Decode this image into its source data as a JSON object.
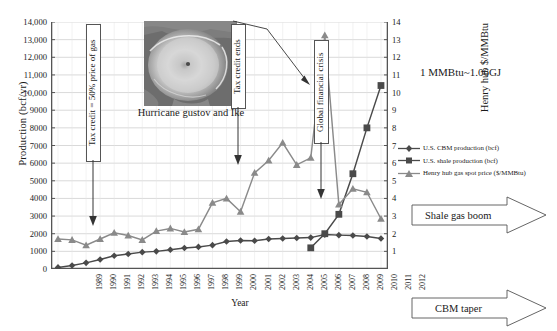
{
  "chart_data": {
    "type": "line",
    "title": "",
    "xlabel": "Year",
    "ylabel": "Production (bcf/yr)",
    "ylabel_right": "Henry hub $/MMBtu",
    "ylim": [
      0,
      14000
    ],
    "ylim_right": [
      0,
      14
    ],
    "grid": true,
    "legend_position": "right",
    "x": [
      1989,
      1990,
      1991,
      1992,
      1993,
      1994,
      1995,
      1996,
      1997,
      1998,
      1999,
      2000,
      2001,
      2002,
      2003,
      2004,
      2005,
      2006,
      2007,
      2008,
      2009,
      2010,
      2011,
      2012
    ],
    "yticks_left": [
      "0",
      "1000",
      "2000",
      "3000",
      "4000",
      "5000",
      "6000",
      "7000",
      "8000",
      "9000",
      "10,000",
      "11,000",
      "12,000",
      "13,000",
      "14,000"
    ],
    "yticks_right": [
      "1",
      "2",
      "3",
      "4",
      "5",
      "6",
      "7",
      "8",
      "9",
      "10",
      "11",
      "12",
      "13",
      "14"
    ],
    "series": [
      {
        "name": "U.S. CBM production (bcf)",
        "axis": "left",
        "marker": "diamond",
        "color": "#4a4a4a",
        "values": [
          90,
          196,
          348,
          539,
          752,
          852,
          956,
          1000,
          1090,
          1194,
          1252,
          1353,
          1562,
          1614,
          1600,
          1700,
          1731,
          1758,
          1780,
          1950,
          1920,
          1900,
          1840,
          1730
        ]
      },
      {
        "name": "U.S. shale production (bcf)",
        "axis": "left",
        "marker": "square",
        "color": "#4a4a4a",
        "values": [
          null,
          null,
          null,
          null,
          null,
          null,
          null,
          null,
          null,
          null,
          null,
          null,
          null,
          null,
          null,
          null,
          null,
          null,
          1200,
          2000,
          3100,
          5400,
          8000,
          10400
        ]
      },
      {
        "name": "Henry hub gas spot price ($/MMBtu)",
        "axis": "right",
        "marker": "triangle",
        "color": "#8a8a8a",
        "values": [
          1.7,
          1.65,
          1.35,
          1.7,
          2.05,
          1.9,
          1.65,
          2.15,
          2.3,
          2.1,
          2.25,
          3.75,
          4.0,
          3.25,
          5.45,
          6.15,
          7.15,
          5.9,
          6.3,
          13.25,
          3.65,
          4.55,
          4.35,
          2.85
        ]
      }
    ],
    "annotations": [
      {
        "id": "tax-credit-start",
        "text": "Tax credit = 50% price of gas",
        "points_to_year": 1991
      },
      {
        "id": "tax-credit-ends",
        "text": "Tax credit ends",
        "points_to_year": 2002
      },
      {
        "id": "global-financial-crisis",
        "text": "Global financial crisis",
        "points_to_year": 2009
      },
      {
        "id": "hurricane-caption",
        "text": "Hurricane gustov and Ike",
        "points_to_year": 2008
      },
      {
        "id": "unit-conversion",
        "text": "1 MMBtu~1.06GJ"
      },
      {
        "id": "shale-gas-boom",
        "text": "Shale gas boom"
      },
      {
        "id": "cbm-taper",
        "text": "CBM  taper"
      }
    ]
  },
  "axes": {
    "left_title": "Production (bcf/yr)",
    "right_title": "Henry hub $/MMBtu",
    "x_title": "Year"
  },
  "legend": {
    "items": [
      {
        "label": "U.S. CBM production (bcf)",
        "marker": "diamond-marker-icon"
      },
      {
        "label": "U.S. shale production (bcf)",
        "marker": "square-marker-icon"
      },
      {
        "label": "Henry hub gas spot price ($/MMBtu)",
        "marker": "triangle-marker-icon"
      }
    ]
  },
  "callouts": {
    "tax_credit_start": "Tax credit = 50% price of gas",
    "tax_credit_ends": "Tax credit ends",
    "global_financial_crisis": "Global financial crisis",
    "hurricane_caption": "Hurricane gustov and Ike",
    "unit_conversion": "1 MMBtu~1.06GJ",
    "shale_gas_boom": "Shale gas boom",
    "cbm_taper": "CBM  taper"
  },
  "colors": {
    "grid": "#c9c9c9",
    "axis": "#555555",
    "series_dark": "#4a4a4a",
    "series_light": "#8a8a8a",
    "text": "#1a1a1a"
  }
}
